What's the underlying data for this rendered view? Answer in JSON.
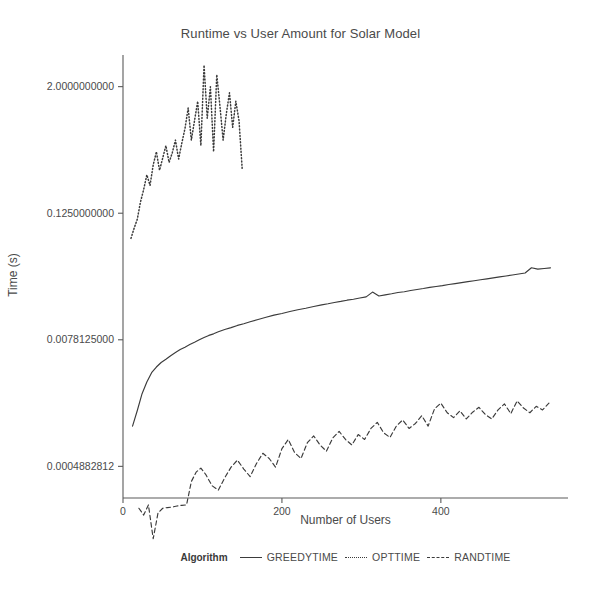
{
  "chart_data": {
    "type": "line",
    "title": "Runtime vs User Amount for Solar Model",
    "xlabel": "Number of Users",
    "ylabel": "Time (s)",
    "yscale": "log2",
    "xlim": [
      0,
      560
    ],
    "ylim": [
      0.000244140625,
      4.0
    ],
    "grid": false,
    "legend_position": "bottom",
    "legend_title": "Algorithm",
    "xticks": [
      0,
      200,
      400
    ],
    "xtick_labels": [
      "0",
      "200",
      "400"
    ],
    "yticks": [
      2.0,
      0.125,
      0.0078125,
      0.0004882812
    ],
    "ytick_labels": [
      "2.0000000000",
      "0.1250000000",
      "0.0078125000",
      "0.0004882812"
    ],
    "series": [
      {
        "name": "GREEDYTIME",
        "linestyle": "solid",
        "color": "#3b3b3b",
        "x": [
          12,
          18,
          24,
          30,
          36,
          42,
          48,
          54,
          60,
          66,
          72,
          78,
          84,
          90,
          96,
          102,
          108,
          114,
          120,
          128,
          136,
          144,
          152,
          160,
          170,
          180,
          190,
          200,
          210,
          220,
          230,
          240,
          250,
          258,
          266,
          274,
          282,
          290,
          298,
          306,
          314,
          322,
          330,
          338,
          346,
          354,
          362,
          370,
          378,
          386,
          394,
          402,
          410,
          418,
          426,
          434,
          442,
          450,
          458,
          466,
          474,
          482,
          490,
          498,
          506,
          514,
          522,
          530,
          538
        ],
        "y": [
          0.00118,
          0.00166,
          0.0024,
          0.0031,
          0.0038,
          0.0043,
          0.00475,
          0.0051,
          0.0055,
          0.0059,
          0.0063,
          0.00665,
          0.00705,
          0.0074,
          0.0078,
          0.0082,
          0.0086,
          0.0089,
          0.0093,
          0.0098,
          0.0102,
          0.0107,
          0.0111,
          0.0116,
          0.0122,
          0.0128,
          0.0134,
          0.0139,
          0.0145,
          0.0151,
          0.0156,
          0.0162,
          0.0168,
          0.0172,
          0.0177,
          0.0181,
          0.0186,
          0.019,
          0.0195,
          0.02,
          0.0222,
          0.0204,
          0.0209,
          0.0214,
          0.022,
          0.0224,
          0.023,
          0.0235,
          0.024,
          0.0246,
          0.0251,
          0.0256,
          0.0262,
          0.0267,
          0.0273,
          0.0279,
          0.0285,
          0.0291,
          0.0297,
          0.0303,
          0.031,
          0.0316,
          0.0323,
          0.033,
          0.0337,
          0.0378,
          0.0367,
          0.0372,
          0.0378
        ]
      },
      {
        "name": "OPTTIME",
        "linestyle": "dotted",
        "color": "#3b3b3b",
        "x": [
          10,
          14,
          18,
          22,
          26,
          30,
          34,
          38,
          42,
          46,
          50,
          54,
          58,
          62,
          66,
          70,
          74,
          78,
          82,
          86,
          90,
          94,
          98,
          102,
          106,
          110,
          114,
          118,
          122,
          126,
          130,
          134,
          138,
          142,
          146,
          150
        ],
        "y": [
          0.072,
          0.09,
          0.11,
          0.16,
          0.21,
          0.29,
          0.23,
          0.36,
          0.48,
          0.32,
          0.42,
          0.55,
          0.38,
          0.47,
          0.62,
          0.41,
          0.58,
          0.8,
          1.25,
          0.62,
          0.95,
          1.45,
          0.55,
          3.2,
          1.0,
          2.0,
          0.48,
          2.6,
          1.3,
          0.62,
          1.1,
          1.75,
          0.82,
          1.45,
          0.95,
          0.33
        ]
      },
      {
        "name": "RANDTIME",
        "linestyle": "dashed",
        "color": "#3b3b3b",
        "x": [
          20,
          26,
          32,
          38,
          44,
          50,
          56,
          62,
          68,
          74,
          80,
          86,
          92,
          98,
          104,
          112,
          120,
          128,
          136,
          144,
          152,
          160,
          168,
          176,
          184,
          192,
          200,
          208,
          216,
          224,
          232,
          240,
          248,
          256,
          264,
          272,
          280,
          288,
          296,
          304,
          312,
          320,
          328,
          336,
          344,
          352,
          360,
          368,
          376,
          384,
          392,
          400,
          408,
          416,
          424,
          432,
          440,
          448,
          456,
          464,
          472,
          480,
          488,
          496,
          504,
          512,
          520,
          528,
          536
        ],
        "y": [
          0.000195,
          0.000168,
          0.00021,
          0.0001,
          0.000175,
          0.000195,
          0.000198,
          0.0002,
          0.000205,
          0.000208,
          0.00021,
          0.00035,
          0.00043,
          0.00047,
          0.00041,
          0.00032,
          0.00029,
          0.00038,
          0.00048,
          0.00056,
          0.00046,
          0.00039,
          0.00052,
          0.00065,
          0.00058,
          0.00048,
          0.00072,
          0.00088,
          0.00066,
          0.00058,
          0.00082,
          0.00095,
          0.00078,
          0.00068,
          0.00091,
          0.00105,
          0.00088,
          0.00078,
          0.00098,
          0.00088,
          0.00112,
          0.00128,
          0.00102,
          0.00092,
          0.00118,
          0.00135,
          0.00112,
          0.00125,
          0.00148,
          0.00118,
          0.00172,
          0.00195,
          0.00158,
          0.00142,
          0.00165,
          0.00138,
          0.0016,
          0.00178,
          0.00152,
          0.00138,
          0.00168,
          0.00192,
          0.00155,
          0.00205,
          0.00175,
          0.00158,
          0.00182,
          0.00168,
          0.00195
        ]
      }
    ]
  },
  "legend": {
    "title": "Algorithm",
    "entries": [
      {
        "label": "GREEDYTIME",
        "style": "solid"
      },
      {
        "label": "OPTTIME",
        "style": "dotted"
      },
      {
        "label": "RANDTIME",
        "style": "dashed"
      }
    ]
  }
}
